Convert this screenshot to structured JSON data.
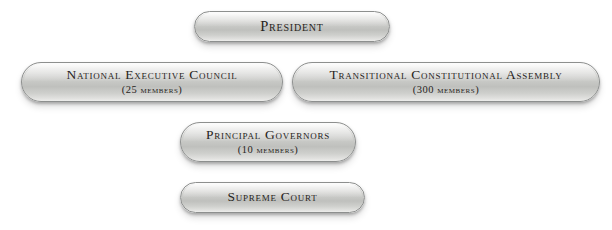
{
  "diagram": {
    "type": "org-chart",
    "background_color": "#ffffff",
    "width": 612,
    "height": 230,
    "node_fill_top_color": "#f2f2f1",
    "node_fill_mid_color": "#bfc0bd",
    "node_border_color": "#8d8f8e",
    "node_text_color": "#272421",
    "nodes": [
      {
        "id": "president",
        "label": "President",
        "sub_label": "",
        "row": 1
      },
      {
        "id": "national-executive-council",
        "label": "National Executive Council",
        "sub_label": "(25 members)",
        "row": 2
      },
      {
        "id": "transitional-constitutional-assembly",
        "label": "Transitional Constitutional Assembly",
        "sub_label": "(300 members)",
        "row": 2
      },
      {
        "id": "principal-governors",
        "label": "Principal  Governors",
        "sub_label": "(10 members)",
        "row": 3
      },
      {
        "id": "supreme-court",
        "label": "Supreme Court",
        "sub_label": "",
        "row": 4
      }
    ]
  }
}
